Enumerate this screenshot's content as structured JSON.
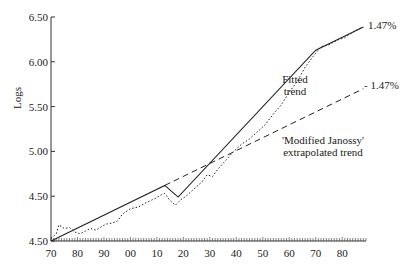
{
  "chart_data": {
    "type": "line",
    "title": "",
    "xlabel": "",
    "ylabel": "Logs",
    "x_tick_labels": [
      "70",
      "80",
      "90",
      "00",
      "10",
      "20",
      "30",
      "40",
      "50",
      "60",
      "70",
      "80"
    ],
    "x_years": [
      1870,
      1880,
      1890,
      1900,
      1910,
      1920,
      1930,
      1940,
      1950,
      1960,
      1970,
      1980
    ],
    "y_tick_labels": [
      "6.50",
      "6.00",
      "5.50",
      "5.00",
      "4.50",
      "4.50"
    ],
    "y_ticks": [
      6.5,
      6.0,
      5.5,
      5.0,
      4.5,
      4.0
    ],
    "xlim": [
      1870,
      1989
    ],
    "ylim": [
      4.0,
      6.5
    ],
    "grid": false,
    "series": [
      {
        "name": "Actual (dotted)",
        "style": "dotted",
        "points": [
          [
            1870,
            4.03
          ],
          [
            1872,
            4.08
          ],
          [
            1873,
            4.18
          ],
          [
            1875,
            4.14
          ],
          [
            1877,
            4.15
          ],
          [
            1879,
            4.1
          ],
          [
            1881,
            4.08
          ],
          [
            1883,
            4.11
          ],
          [
            1885,
            4.14
          ],
          [
            1887,
            4.12
          ],
          [
            1889,
            4.16
          ],
          [
            1891,
            4.19
          ],
          [
            1893,
            4.2
          ],
          [
            1895,
            4.22
          ],
          [
            1897,
            4.3
          ],
          [
            1900,
            4.36
          ],
          [
            1903,
            4.38
          ],
          [
            1906,
            4.43
          ],
          [
            1909,
            4.47
          ],
          [
            1912,
            4.52
          ],
          [
            1913,
            4.53
          ],
          [
            1915,
            4.45
          ],
          [
            1917,
            4.4
          ],
          [
            1919,
            4.46
          ],
          [
            1921,
            4.5
          ],
          [
            1924,
            4.58
          ],
          [
            1927,
            4.66
          ],
          [
            1929,
            4.74
          ],
          [
            1931,
            4.72
          ],
          [
            1933,
            4.8
          ],
          [
            1936,
            4.9
          ],
          [
            1939,
            5.0
          ],
          [
            1942,
            5.08
          ],
          [
            1945,
            5.14
          ],
          [
            1948,
            5.22
          ],
          [
            1951,
            5.3
          ],
          [
            1954,
            5.42
          ],
          [
            1957,
            5.52
          ],
          [
            1960,
            5.66
          ],
          [
            1963,
            5.78
          ],
          [
            1966,
            5.94
          ],
          [
            1969,
            6.06
          ],
          [
            1972,
            6.17
          ],
          [
            1975,
            6.19
          ],
          [
            1978,
            6.24
          ],
          [
            1981,
            6.27
          ],
          [
            1984,
            6.33
          ],
          [
            1987,
            6.38
          ]
        ]
      },
      {
        "name": "Fitted trend",
        "style": "solid",
        "points": [
          [
            1870,
            4.0
          ],
          [
            1913,
            4.62
          ],
          [
            1918,
            4.49
          ],
          [
            1970,
            6.13
          ],
          [
            1988,
            6.39
          ]
        ],
        "end_label": "1.47%"
      },
      {
        "name": "'Modified Janossy' extrapolated trend",
        "style": "dashed",
        "points": [
          [
            1913,
            4.62
          ],
          [
            1988,
            5.7
          ]
        ],
        "end_label": "1.47%"
      }
    ],
    "annotations": [
      {
        "text": "Fitted trend",
        "lines": [
          "Fitted",
          "trend"
        ]
      },
      {
        "text": "'Modified Janossy' extrapolated trend",
        "lines": [
          "'Modified Janossy'",
          "extrapolated trend"
        ]
      },
      {
        "text": "1.47%",
        "target": "Fitted trend end"
      },
      {
        "text": "1.47%",
        "target": "Janossy trend end"
      }
    ]
  },
  "labels": {
    "ylabel": "Logs",
    "fitted_line1": "Fitted",
    "fitted_line2": "trend",
    "janossy_line1": "'Modified Janossy'",
    "janossy_line2": "extrapolated trend",
    "rate_fitted": "1.47%",
    "rate_janossy": "- 1.47%"
  }
}
